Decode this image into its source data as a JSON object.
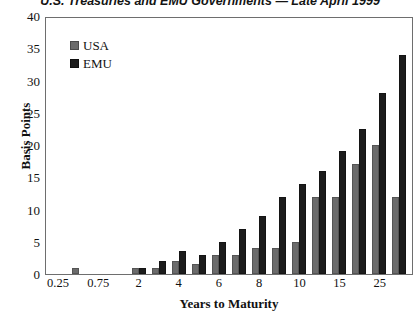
{
  "chart_data": {
    "type": "bar",
    "title": "U.S. Treasuries and EMU Governments — Late April 1999",
    "xlabel": "Years to Maturity",
    "ylabel": "Basis Points",
    "ylim": [
      0,
      40
    ],
    "yticks": [
      0,
      5,
      10,
      15,
      20,
      25,
      30,
      35,
      40
    ],
    "grid": false,
    "legend_position": "top-left",
    "categories": [
      "0.25",
      "0.5",
      "0.75",
      "1",
      "2",
      "3",
      "4",
      "5",
      "6",
      "7",
      "8",
      "9",
      "10",
      "12",
      "15",
      "20",
      "25",
      "30"
    ],
    "xtick_labels": [
      "0.25",
      "0.75",
      "2",
      "4",
      "6",
      "8",
      "10",
      "15",
      "25"
    ],
    "series": [
      {
        "name": "USA",
        "color": "#6b6b6b",
        "values": [
          0,
          1,
          0,
          0,
          1,
          1,
          2,
          1.5,
          3,
          3,
          4,
          4,
          5,
          12,
          12,
          17,
          20,
          12
        ]
      },
      {
        "name": "EMU",
        "color": "#1c1c1c",
        "values": [
          0,
          0,
          0,
          0,
          1,
          2,
          3.5,
          3,
          5,
          7,
          9,
          12,
          14,
          16,
          19,
          22.5,
          28,
          34
        ]
      }
    ],
    "extra_series_note": ""
  },
  "legend": {
    "items": [
      {
        "label": "USA",
        "color": "#6b6b6b",
        "swatch": "square-swatch"
      },
      {
        "label": "EMU",
        "color": "#1c1c1c",
        "swatch": "square-swatch"
      }
    ]
  }
}
